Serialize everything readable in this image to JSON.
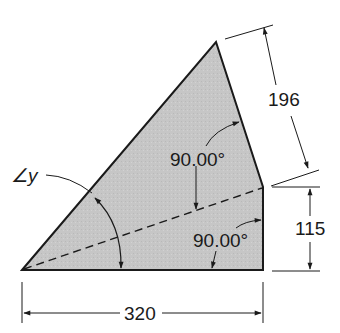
{
  "diagram": {
    "type": "technical-drawing",
    "shape": "quadrilateral composed of two right triangles",
    "colors": {
      "fill": "#c8c8c8",
      "stroke": "#1a1a1a",
      "background": "#ffffff"
    },
    "dimensions": {
      "base": "320",
      "right_vertical": "115",
      "upper_right_edge": "196"
    },
    "angles": {
      "upper_right_angle": "90.00°",
      "lower_right_angle": "90.00°",
      "unknown_angle": "∠y"
    }
  }
}
